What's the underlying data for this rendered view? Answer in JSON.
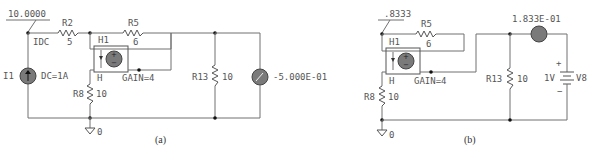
{
  "figure_a": {
    "caption": "(a)",
    "node_voltage": "10.0000",
    "current_probe_label": "IDC",
    "source": {
      "name": "I1",
      "value": "DC=1A"
    },
    "resistors": [
      {
        "name": "R2",
        "value": "5"
      },
      {
        "name": "R5",
        "value": "6"
      },
      {
        "name": "R8",
        "value": "10"
      },
      {
        "name": "R13",
        "value": "10"
      }
    ],
    "ccvs": {
      "name": "H1",
      "pin_label": "H",
      "gain": "GAIN=4",
      "plus": "+",
      "minus": "−"
    },
    "ammeter_reading": "-5.000E-01",
    "ground": "0"
  },
  "figure_b": {
    "caption": "(b)",
    "node_voltage": ".8333",
    "resistors": [
      {
        "name": "R5",
        "value": "6"
      },
      {
        "name": "R8",
        "value": "10"
      },
      {
        "name": "R13",
        "value": "10"
      }
    ],
    "ccvs": {
      "name": "H1",
      "pin_label": "H",
      "gain": "GAIN=4",
      "plus": "+",
      "minus": "−"
    },
    "ammeter_reading": "1.833E-01",
    "voltage_source": {
      "name": "V8",
      "value": "1V",
      "plus": "+",
      "minus": "−"
    },
    "ground": "0"
  }
}
